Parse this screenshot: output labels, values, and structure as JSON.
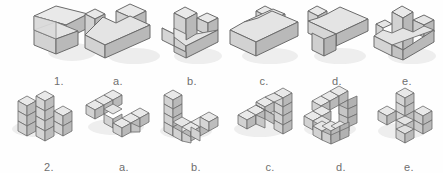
{
  "page": {
    "background_color": "#ffffff"
  },
  "palette": {
    "face_top": "#e9e9e9",
    "face_left": "#d2d2d2",
    "face_right": "#b9b9b9",
    "face_top_dark": "#dedede",
    "outline": "#6b6b6b",
    "inner_line": "#8a8a8a",
    "shadow": "#d8d8d8",
    "label_text": "#6f6f6f"
  },
  "rows": [
    {
      "id": "row-1",
      "type": "solid-blocks",
      "figures": [
        {
          "id": "r1-q",
          "label": "1.",
          "role": "question",
          "x": 20,
          "width": 78
        },
        {
          "id": "r1-a",
          "label": "a.",
          "role": "option",
          "x": 72,
          "width": 92
        },
        {
          "id": "r1-b",
          "label": "b.",
          "role": "option",
          "x": 152,
          "width": 80
        },
        {
          "id": "r1-c",
          "label": "c.",
          "role": "option",
          "x": 222,
          "width": 84
        },
        {
          "id": "r1-d",
          "label": "d.",
          "role": "option",
          "x": 296,
          "width": 82
        },
        {
          "id": "r1-e",
          "label": "e.",
          "role": "option",
          "x": 368,
          "width": 78
        }
      ]
    },
    {
      "id": "row-2",
      "type": "unit-cube-assemblies",
      "figures": [
        {
          "id": "r2-q",
          "label": "2.",
          "role": "question",
          "x": 8,
          "width": 82
        },
        {
          "id": "r2-a",
          "label": "a.",
          "role": "option",
          "x": 82,
          "width": 84
        },
        {
          "id": "r2-b",
          "label": "b.",
          "role": "option",
          "x": 156,
          "width": 80
        },
        {
          "id": "r2-c",
          "label": "c.",
          "role": "option",
          "x": 230,
          "width": 80
        },
        {
          "id": "r2-d",
          "label": "d.",
          "role": "option",
          "x": 300,
          "width": 82
        },
        {
          "id": "r2-e",
          "label": "e.",
          "role": "option",
          "x": 372,
          "width": 74
        }
      ]
    }
  ],
  "labels": {
    "r1_q": "1.",
    "r1_a": "a.",
    "r1_b": "b.",
    "r1_c": "c.",
    "r1_d": "d.",
    "r1_e": "e.",
    "r2_q": "2.",
    "r2_a": "a.",
    "r2_b": "b.",
    "r2_c": "c.",
    "r2_d": "d.",
    "r2_e": "e."
  }
}
